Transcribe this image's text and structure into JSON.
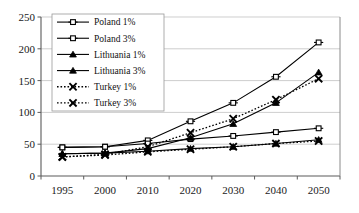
{
  "chart_data": {
    "type": "line",
    "title": "",
    "xlabel": "",
    "ylabel": "",
    "x": [
      1995,
      2000,
      2010,
      2020,
      2030,
      2040,
      2050
    ],
    "xtick_labels": [
      "1995",
      "2000",
      "2010",
      "2020",
      "2030",
      "2040",
      "2050"
    ],
    "ytick_labels": [
      "0",
      "50",
      "100",
      "150",
      "200",
      "250"
    ],
    "yticks": [
      0,
      50,
      100,
      150,
      200,
      250
    ],
    "ylim": [
      0,
      250
    ],
    "grid": "horizontal",
    "legend_position": "upper-left-inside",
    "series": [
      {
        "name": "Poland 1%",
        "marker": "open-square",
        "line": "solid",
        "values": [
          45,
          46,
          56,
          86,
          115,
          156,
          210
        ]
      },
      {
        "name": "Poland 3%",
        "marker": "open-square",
        "line": "solid",
        "values": [
          45,
          46,
          51,
          58,
          63,
          69,
          75
        ]
      },
      {
        "name": "Lithuania 1%",
        "marker": "filled-triangle",
        "line": "solid",
        "values": [
          35,
          36,
          43,
          60,
          82,
          115,
          163
        ]
      },
      {
        "name": "Lithuania 3%",
        "marker": "filled-triangle",
        "line": "solid",
        "values": [
          35,
          36,
          39,
          43,
          46,
          51,
          57
        ]
      },
      {
        "name": "Turkey 1%",
        "marker": "cross-x",
        "line": "dotted",
        "values": [
          30,
          34,
          46,
          68,
          90,
          120,
          153
        ]
      },
      {
        "name": "Turkey 3%",
        "marker": "cross-x",
        "line": "dotted",
        "values": [
          30,
          33,
          38,
          42,
          46,
          51,
          55
        ]
      }
    ]
  }
}
